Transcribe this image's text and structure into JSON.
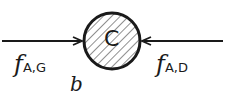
{
  "diagram": {
    "center_label": "C",
    "left_force": {
      "symbol": "f",
      "subscript": "A,G"
    },
    "right_force": {
      "symbol": "f",
      "subscript": "A,D"
    },
    "panel_label": "b"
  },
  "colors": {
    "stroke": "#1a1a1a",
    "background": "#ffffff"
  }
}
